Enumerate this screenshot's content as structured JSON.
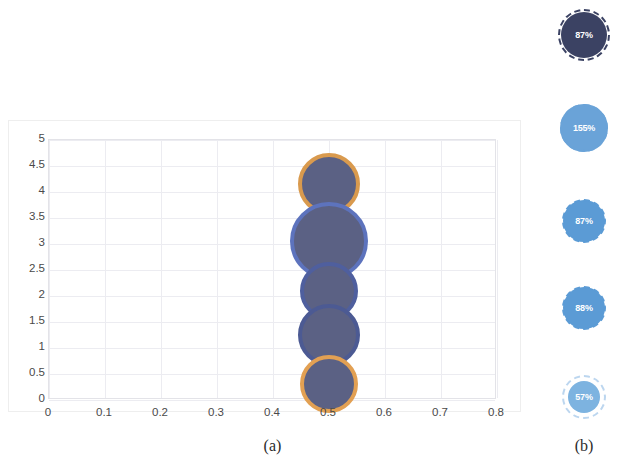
{
  "figure": {
    "panel_a_caption": "(a)",
    "panel_b_caption": "(b)"
  },
  "chart_data": {
    "type": "scatter",
    "title": "",
    "xlabel": "",
    "ylabel": "",
    "xlim": [
      0,
      0.8
    ],
    "ylim": [
      0,
      5
    ],
    "grid": true,
    "legend": "none",
    "xticks": [
      "0",
      "0.1",
      "0.2",
      "0.3",
      "0.4",
      "0.5",
      "0.6",
      "0.7",
      "0.8"
    ],
    "yticks": [
      "0",
      "0.5",
      "1",
      "1.5",
      "2",
      "2.5",
      "3",
      "3.5",
      "4",
      "4.5",
      "5"
    ],
    "series": [
      {
        "name": "bubbles",
        "points": [
          {
            "label": "bubble-1",
            "x": 0.5,
            "y": 4.15,
            "size": 62,
            "fill": "#5b6184",
            "edge": "#d99a4e"
          },
          {
            "label": "bubble-2",
            "x": 0.5,
            "y": 3.05,
            "size": 78,
            "fill": "#5b6184",
            "edge": "#5d73bd"
          },
          {
            "label": "bubble-3",
            "x": 0.5,
            "y": 2.1,
            "size": 58,
            "fill": "#5b6184",
            "edge": "#4f5f9e"
          },
          {
            "label": "bubble-4",
            "x": 0.5,
            "y": 1.25,
            "size": 62,
            "fill": "#5b6184",
            "edge": "#4c5a93"
          },
          {
            "label": "bubble-5",
            "x": 0.5,
            "y": 0.3,
            "size": 58,
            "fill": "#5b6184",
            "edge": "#e2a053"
          }
        ]
      }
    ]
  },
  "badges": [
    {
      "name": "badge-87-dark",
      "value": "87%",
      "fill": "#3b4263",
      "ring": "#3b4263",
      "diameter": 46,
      "ring_diameter": 52,
      "top": 12,
      "ring_style": "dashed"
    },
    {
      "name": "badge-155",
      "value": "155%",
      "fill": "#6aa3d8",
      "ring": "#6aa3d8",
      "diameter": 48,
      "ring_diameter": 48,
      "top": 104,
      "ring_style": "dashed"
    },
    {
      "name": "badge-87-blue",
      "value": "87%",
      "fill": "#5b9bd5",
      "ring": "#5b9bd5",
      "diameter": 42,
      "ring_diameter": 44,
      "top": 200,
      "ring_style": "dashed"
    },
    {
      "name": "badge-88",
      "value": "88%",
      "fill": "#5b9bd5",
      "ring": "#5b9bd5",
      "diameter": 42,
      "ring_diameter": 44,
      "top": 287,
      "ring_style": "dashed"
    },
    {
      "name": "badge-57",
      "value": "57%",
      "fill": "#7db3e0",
      "ring": "#bcd6ef",
      "diameter": 32,
      "ring_diameter": 44,
      "top": 381,
      "ring_style": "dashed"
    }
  ]
}
